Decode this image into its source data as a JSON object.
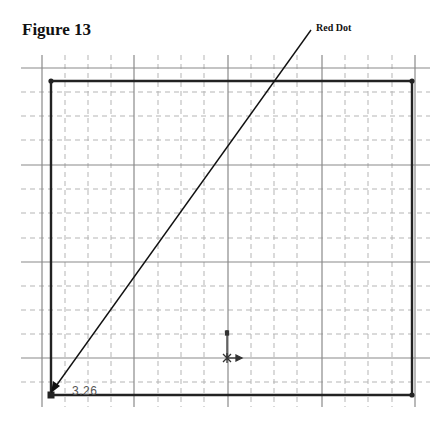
{
  "figure": {
    "title": "Figure 13",
    "callout_label": "Red Dot",
    "dimension_label": "3.26"
  },
  "colors": {
    "background": "#ffffff",
    "major_grid": "#8a8a8a",
    "minor_grid": "#b5b5b5",
    "rectangle": "#222222",
    "leader": "#111111",
    "dimension_text": "#555555"
  },
  "grid": {
    "major_x": [
      42,
      134,
      228,
      322,
      415
    ],
    "minor_x": [
      65,
      88,
      111,
      158,
      181,
      204,
      251,
      274,
      297,
      345,
      368,
      392
    ],
    "major_y": [
      68,
      165,
      262,
      358
    ],
    "minor_y": [
      92,
      116,
      140,
      189,
      213,
      238,
      286,
      310,
      334,
      382
    ],
    "x_extent": [
      21,
      430
    ],
    "y_extent": [
      55,
      407
    ]
  },
  "rectangle": {
    "x1": 51,
    "y1": 81,
    "x2": 412,
    "y2": 395
  },
  "leader_line": {
    "from": [
      311,
      30
    ],
    "to": [
      52,
      392
    ]
  },
  "origin_marker": {
    "x": 227,
    "y": 358
  }
}
